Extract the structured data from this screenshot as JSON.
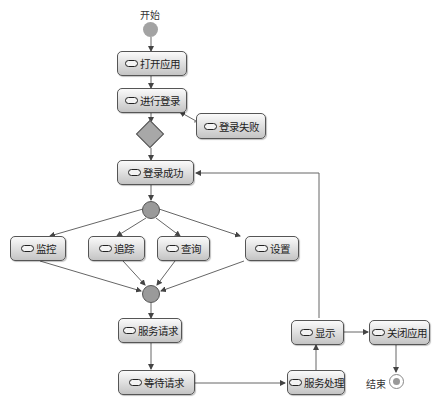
{
  "start_label": "开始",
  "end_label": "结束",
  "nodes": {
    "open_app": "打开应用",
    "login": "进行登录",
    "login_fail": "登录失败",
    "login_success": "登录成功",
    "monitor": "监控",
    "track": "追踪",
    "query": "查询",
    "settings": "设置",
    "service_request": "服务请求",
    "wait_request": "等待请求",
    "service_process": "服务处理",
    "display": "显示",
    "close_app": "关闭应用"
  },
  "colors": {
    "node_fill": "#d6d6d6",
    "start_fill": "#a0a0a0",
    "line": "#555555"
  }
}
